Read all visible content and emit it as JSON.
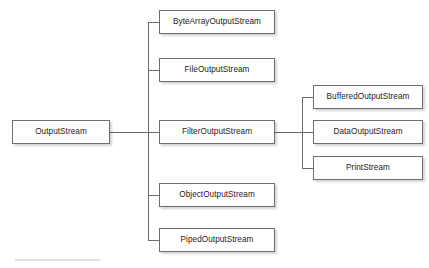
{
  "diagram": {
    "background_color": "#ffffff",
    "box_fill": "#ffffff",
    "box_border_color": "#6e6e6e",
    "edge_color": "#6b6b6b",
    "text_color": "#1b1b1b",
    "footer_rule_color": "#e2e2e4",
    "nodes": {
      "root": {
        "label": "OutputStream",
        "x": 12,
        "y": 120,
        "w": 98,
        "h": 24
      },
      "byte_array": {
        "label": "ByteArrayOutputStream",
        "x": 159,
        "y": 10,
        "w": 116,
        "h": 24
      },
      "file": {
        "label": "FileOutputStream",
        "x": 159,
        "y": 58,
        "w": 116,
        "h": 24
      },
      "filter": {
        "label": "FilterOutputStream",
        "x": 159,
        "y": 120,
        "w": 116,
        "h": 24
      },
      "object": {
        "label": "ObjectOutputStream",
        "x": 159,
        "y": 183,
        "w": 116,
        "h": 24
      },
      "piped": {
        "label": "PipedOutputStream",
        "x": 159,
        "y": 228,
        "w": 116,
        "h": 24
      },
      "buffered": {
        "label": "BufferedOutputStream",
        "x": 313,
        "y": 85,
        "w": 110,
        "h": 24
      },
      "data": {
        "label": "DataOutputStream",
        "x": 313,
        "y": 120,
        "w": 110,
        "h": 24
      },
      "print": {
        "label": "PrintStream",
        "x": 313,
        "y": 156,
        "w": 110,
        "h": 24
      }
    },
    "edges": {
      "root_to_trunk": {
        "x": 110,
        "y": 132,
        "w": 49
      },
      "left_trunk": {
        "x": 148,
        "y": 22,
        "h": 218
      },
      "stub_byte_array": {
        "x": 148,
        "y": 22,
        "w": 11
      },
      "stub_file": {
        "x": 148,
        "y": 70,
        "w": 11
      },
      "stub_filter": {
        "x": 148,
        "y": 132,
        "w": 11
      },
      "stub_object": {
        "x": 148,
        "y": 195,
        "w": 11
      },
      "stub_piped": {
        "x": 148,
        "y": 240,
        "w": 11
      },
      "filter_to_trunk": {
        "x": 275,
        "y": 132,
        "w": 27
      },
      "right_trunk": {
        "x": 302,
        "y": 97,
        "h": 71
      },
      "stub_buffered": {
        "x": 302,
        "y": 97,
        "w": 11
      },
      "stub_data": {
        "x": 302,
        "y": 132,
        "w": 11
      },
      "stub_print": {
        "x": 302,
        "y": 168,
        "w": 11
      }
    },
    "footer_rule": {
      "x": 15,
      "y": 259,
      "w": 85
    }
  }
}
